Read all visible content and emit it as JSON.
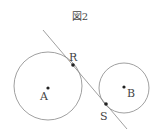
{
  "figure": {
    "title": "図2",
    "labels": {
      "A": "A",
      "B": "B",
      "R": "R",
      "S": "S"
    },
    "colors": {
      "stroke": "#777777",
      "point": "#222222",
      "text": "#444444"
    }
  }
}
